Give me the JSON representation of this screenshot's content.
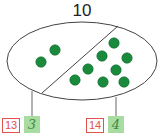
{
  "diagram": {
    "total": "10",
    "left_part": {
      "dot_count": 2
    },
    "right_part": {
      "dot_count": 8
    },
    "labels": [
      {
        "number": "13",
        "answer": "3"
      },
      {
        "number": "14",
        "answer": "4"
      }
    ],
    "colors": {
      "dot": "#1a8a3c",
      "label_border": "#e0524a",
      "answer_bg": "#a8dca0"
    }
  }
}
